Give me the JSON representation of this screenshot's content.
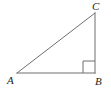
{
  "figure": {
    "kind": "right-triangle-diagram",
    "background_color": "#ffffff",
    "stroke_color": "#6d6e70",
    "label_color": "#231f20",
    "stroke_width": 1,
    "canvas": {
      "width": 111,
      "height": 92
    },
    "vertices": [
      {
        "name": "A",
        "label": "A",
        "x": 17,
        "y": 73,
        "angle_deg": 37.6
      },
      {
        "name": "B",
        "label": "B",
        "x": 95,
        "y": 73,
        "angle_deg": 90
      },
      {
        "name": "C",
        "label": "C",
        "x": 95,
        "y": 13,
        "angle_deg": 52.4
      }
    ],
    "sides": [
      {
        "name": "AB",
        "from": "A",
        "to": "B",
        "role": "base-leg",
        "length_px": 78
      },
      {
        "name": "BC",
        "from": "B",
        "to": "C",
        "role": "vertical-leg",
        "length_px": 60
      },
      {
        "name": "CA",
        "from": "C",
        "to": "A",
        "role": "hypotenuse",
        "length_px": 98
      }
    ],
    "right_angle_marker": {
      "at_vertex": "B",
      "size_px": 12,
      "x": 83,
      "y": 61
    }
  }
}
